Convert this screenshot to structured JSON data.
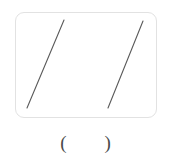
{
  "figure": {
    "caption": "",
    "frame": {
      "shape": "rounded-rectangle",
      "x": 15,
      "y": 12,
      "width": 142,
      "height": 106,
      "corner_radius": 9,
      "border_color": "#e2e2e2",
      "fill_color": "#ffffff"
    },
    "line_color": "#5a5a5a",
    "line_width": 1.1,
    "segments": [
      {
        "label": "left-line-segment",
        "x1": 27,
        "y1": 108,
        "x2": 64,
        "y2": 20
      },
      {
        "label": "right-line-segment",
        "x1": 108,
        "y1": 108,
        "x2": 143,
        "y2": 21
      }
    ]
  },
  "answer": {
    "open_paren": "(",
    "value": "",
    "close_paren": ")"
  }
}
